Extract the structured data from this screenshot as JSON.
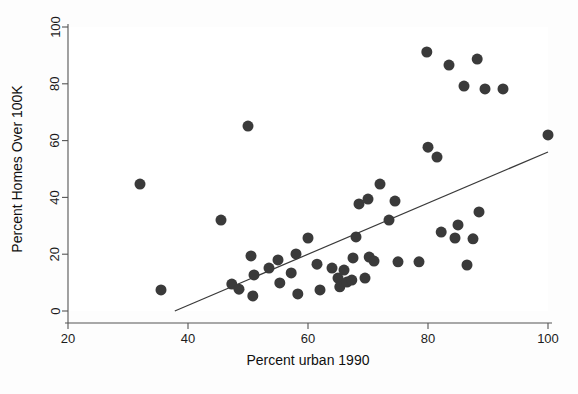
{
  "chart_data": {
    "type": "scatter",
    "title": "",
    "xlabel": "Percent urban 1990",
    "ylabel": "Percent Homes Over 100K",
    "xlim": [
      17,
      102
    ],
    "ylim": [
      -4,
      103
    ],
    "xticks": [
      20,
      40,
      60,
      80,
      100
    ],
    "yticks": [
      0,
      20,
      40,
      60,
      80,
      100
    ],
    "grid": false,
    "legend": null,
    "marker_color": "#3a3a3a",
    "marker_size": 5.5,
    "background_color": "#ffffff",
    "axis_color": "#555555",
    "points": [
      {
        "x": 32.0,
        "y": 44.7
      },
      {
        "x": 35.5,
        "y": 7.4
      },
      {
        "x": 45.5,
        "y": 32.0
      },
      {
        "x": 50.0,
        "y": 65.1
      },
      {
        "x": 47.3,
        "y": 9.5
      },
      {
        "x": 48.5,
        "y": 7.7
      },
      {
        "x": 50.5,
        "y": 19.4
      },
      {
        "x": 50.8,
        "y": 5.3
      },
      {
        "x": 51.0,
        "y": 12.7
      },
      {
        "x": 53.5,
        "y": 15.1
      },
      {
        "x": 55.0,
        "y": 18.0
      },
      {
        "x": 55.3,
        "y": 9.9
      },
      {
        "x": 57.2,
        "y": 13.4
      },
      {
        "x": 58.0,
        "y": 20.1
      },
      {
        "x": 58.3,
        "y": 6.0
      },
      {
        "x": 60.0,
        "y": 25.7
      },
      {
        "x": 61.5,
        "y": 16.5
      },
      {
        "x": 62.0,
        "y": 7.4
      },
      {
        "x": 64.0,
        "y": 15.1
      },
      {
        "x": 65.0,
        "y": 11.6
      },
      {
        "x": 65.3,
        "y": 8.5
      },
      {
        "x": 66.0,
        "y": 14.4
      },
      {
        "x": 66.5,
        "y": 10.2
      },
      {
        "x": 67.3,
        "y": 10.9
      },
      {
        "x": 67.5,
        "y": 18.7
      },
      {
        "x": 68.0,
        "y": 26.1
      },
      {
        "x": 68.5,
        "y": 37.7
      },
      {
        "x": 69.5,
        "y": 11.6
      },
      {
        "x": 70.0,
        "y": 39.4
      },
      {
        "x": 70.2,
        "y": 19.0
      },
      {
        "x": 71.0,
        "y": 17.6
      },
      {
        "x": 72.0,
        "y": 44.7
      },
      {
        "x": 73.5,
        "y": 32.0
      },
      {
        "x": 74.5,
        "y": 38.7
      },
      {
        "x": 75.0,
        "y": 17.3
      },
      {
        "x": 78.5,
        "y": 17.3
      },
      {
        "x": 79.8,
        "y": 91.2
      },
      {
        "x": 80.0,
        "y": 57.7
      },
      {
        "x": 81.5,
        "y": 54.2
      },
      {
        "x": 82.2,
        "y": 27.8
      },
      {
        "x": 83.5,
        "y": 86.6
      },
      {
        "x": 84.5,
        "y": 25.7
      },
      {
        "x": 85.0,
        "y": 30.3
      },
      {
        "x": 86.0,
        "y": 79.2
      },
      {
        "x": 86.5,
        "y": 16.2
      },
      {
        "x": 87.5,
        "y": 25.4
      },
      {
        "x": 88.2,
        "y": 88.7
      },
      {
        "x": 88.5,
        "y": 34.9
      },
      {
        "x": 89.5,
        "y": 78.2
      },
      {
        "x": 92.5,
        "y": 78.2
      },
      {
        "x": 100.0,
        "y": 62.0
      }
    ],
    "fit_line": {
      "label": "regression line",
      "x_start": 37.8,
      "y_start": 0.0,
      "x_end": 100.0,
      "y_end": 56.0
    }
  }
}
